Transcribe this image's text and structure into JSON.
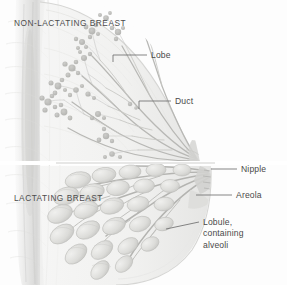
{
  "figure": {
    "background_color": "#fdfdfd",
    "ink_color": "#9aa0a6",
    "text_color": "#4a4a4a",
    "style": "graphite pencil medical illustration, sagittal section"
  },
  "section_headers": [
    {
      "id": "non-lactating",
      "text": "NON-LACTATING BREAST",
      "x": 14,
      "y": 18
    },
    {
      "id": "lactating",
      "text": "LACTATING BREAST",
      "x": 14,
      "y": 193
    }
  ],
  "labels": [
    {
      "id": "lobe",
      "text": "Lobe",
      "text_x": 151,
      "text_y": 50,
      "leader": {
        "x1": 113,
        "y1": 55,
        "x2": 147,
        "y2": 55,
        "tick_x": 113,
        "tick_y2": 62
      }
    },
    {
      "id": "duct",
      "text": "Duct",
      "text_x": 175,
      "text_y": 96,
      "leader": {
        "x1": 139,
        "y1": 101,
        "x2": 171,
        "y2": 101,
        "tick_x": 139,
        "tick_y2": 109
      }
    },
    {
      "id": "nipple",
      "text": "Nipple",
      "text_x": 241,
      "text_y": 164,
      "leader": {
        "x1": 211,
        "y1": 169,
        "x2": 237,
        "y2": 169,
        "tick_x": null,
        "tick_y2": null
      }
    },
    {
      "id": "areola",
      "text": "Areola",
      "text_x": 236,
      "text_y": 190,
      "leader": {
        "x1": 196,
        "y1": 195,
        "x2": 232,
        "y2": 195,
        "tick_x": null,
        "tick_y2": null
      }
    },
    {
      "id": "lobule",
      "text": "Lobule, containing alveoli",
      "lines": [
        "Lobule,",
        "containing",
        "alveoli"
      ],
      "text_x": 203,
      "text_y": 217,
      "leader": {
        "x1": 166,
        "y1": 229,
        "x2": 199,
        "y2": 222,
        "tick_x": null,
        "tick_y2": null
      }
    }
  ],
  "anatomy": {
    "divider_y": 163,
    "nipple_apex_x": 210,
    "chest_wall_x": 38,
    "non_lactating": {
      "description": "Fine branching duct tree with small star-shaped lobes, sparse glandular tissue in fatty stroma",
      "lobe_count": 14,
      "duct_branches": 9
    },
    "lactating": {
      "description": "Enlarged bulbous lobules of alveoli converging on widened lactiferous ducts toward the nipple",
      "alveoli_clusters": 26,
      "duct_branches": 10
    }
  }
}
